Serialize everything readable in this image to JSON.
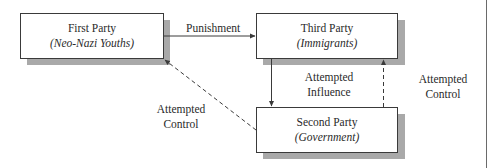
{
  "diagram": {
    "nodes": [
      {
        "id": "first",
        "title": "First Party",
        "subtitle": "(Neo-Nazi Youths)"
      },
      {
        "id": "third",
        "title": "Third Party",
        "subtitle": "(Immigrants)"
      },
      {
        "id": "second",
        "title": "Second Party",
        "subtitle": "(Government)"
      }
    ],
    "edges": [
      {
        "from": "first",
        "to": "third",
        "label": "Punishment",
        "style": "solid"
      },
      {
        "from": "third",
        "to": "second",
        "label_line1": "Attempted",
        "label_line2": "Influence",
        "style": "solid"
      },
      {
        "from": "second",
        "to": "third",
        "label_line1": "Attempted",
        "label_line2": "Control",
        "style": "dashed"
      },
      {
        "from": "second",
        "to": "first",
        "label_line1": "Attempted",
        "label_line2": "Control",
        "style": "dashed"
      }
    ]
  },
  "colors": {
    "line": "#3a3a3a",
    "shadow": "#a9a9a9",
    "box_fill": "#ffffff"
  }
}
